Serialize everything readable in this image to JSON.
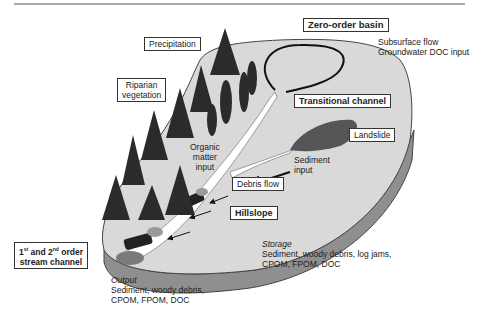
{
  "diagram": {
    "type": "watershed-schematic",
    "labels": {
      "zero_order_basin": "Zero-order basin",
      "subsurface_flow": "Subsurface flow",
      "groundwater": "Groundwater DOC input",
      "precipitation": "Precipitation",
      "riparian_1": "Riparian",
      "riparian_2": "vegetation",
      "transitional_channel": "Transitional channel",
      "landslide": "Landslide",
      "organic_1": "Organic",
      "organic_2": "matter",
      "organic_3": "input",
      "sediment_1": "Sediment",
      "sediment_2": "input",
      "debris_flow": "Debris flow",
      "hillslope": "Hillslope",
      "stream_1_pre": "1",
      "stream_1_sup": "st",
      "stream_1_mid": " and 2",
      "stream_1_sup2": "nd",
      "stream_1_post": " order",
      "stream_2": "stream channel",
      "storage_title": "Storage",
      "storage_1": "Sediment, woody debris, log jams,",
      "storage_2": "CPOM, FPOM, DOC",
      "output_title": "Output",
      "output_1": "Sediment, woody debris,",
      "output_2": "CPOM, FPOM, DOC"
    },
    "colors": {
      "ground": "#d9d9d9",
      "ground_edge": "#8a8a8a",
      "trees": "#2b2b2b",
      "channel": "#ffffff",
      "landslide": "#5a5a5a",
      "border": "#333333"
    }
  }
}
